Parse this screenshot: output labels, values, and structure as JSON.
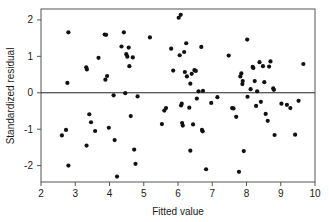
{
  "chart_data": {
    "type": "scatter",
    "title": "",
    "xlabel": "Fitted value",
    "ylabel": "Standardized residual",
    "xlim": [
      2,
      10
    ],
    "ylim": [
      -2.45,
      2.3
    ],
    "xticks": [
      2,
      3,
      4,
      5,
      6,
      7,
      8,
      9,
      10
    ],
    "xtick_labels": [
      "2",
      "3",
      "4",
      "5",
      "6",
      "7",
      "8",
      "9",
      "10"
    ],
    "yticks": [
      2,
      1,
      0,
      -1,
      -2
    ],
    "ytick_labels": [
      "2",
      "1",
      "0",
      "-1",
      "-2"
    ],
    "grid": false,
    "legend": null,
    "annotations": [
      {
        "type": "hline",
        "y": 0,
        "label": "zero-residual-reference-line"
      }
    ],
    "marker": {
      "shape": "circle",
      "size": 2.1,
      "color": "#111111"
    },
    "point_count": 100,
    "points": [
      [
        2.61,
        -1.17
      ],
      [
        2.73,
        -1.02
      ],
      [
        2.77,
        0.27
      ],
      [
        2.8,
        1.66
      ],
      [
        2.8,
        -2.0
      ],
      [
        3.32,
        0.7
      ],
      [
        3.34,
        0.64
      ],
      [
        3.33,
        -1.45
      ],
      [
        3.41,
        -0.59
      ],
      [
        3.46,
        -0.81
      ],
      [
        3.58,
        -1.05
      ],
      [
        3.68,
        0.96
      ],
      [
        3.86,
        1.6
      ],
      [
        3.9,
        1.59
      ],
      [
        3.88,
        0.36
      ],
      [
        3.93,
        0.46
      ],
      [
        3.98,
        -0.96
      ],
      [
        4.12,
        -0.07
      ],
      [
        4.15,
        -1.3
      ],
      [
        4.22,
        -2.3
      ],
      [
        4.35,
        1.27
      ],
      [
        4.42,
        1.66
      ],
      [
        4.46,
        -0.01
      ],
      [
        4.49,
        1.06
      ],
      [
        4.52,
        0.99
      ],
      [
        4.56,
        1.24
      ],
      [
        4.58,
        0.73
      ],
      [
        4.62,
        -0.64
      ],
      [
        4.68,
        0.97
      ],
      [
        4.72,
        -1.56
      ],
      [
        4.76,
        -1.95
      ],
      [
        4.82,
        -0.1
      ],
      [
        5.18,
        1.52
      ],
      [
        5.53,
        -0.86
      ],
      [
        5.6,
        -0.49
      ],
      [
        5.65,
        -0.42
      ],
      [
        5.8,
        1.21
      ],
      [
        5.86,
        0.61
      ],
      [
        6.02,
        2.06
      ],
      [
        6.08,
        2.14
      ],
      [
        6.05,
        1.03
      ],
      [
        6.09,
        -0.35
      ],
      [
        6.11,
        -0.3
      ],
      [
        6.14,
        -0.9
      ],
      [
        6.12,
        -0.83
      ],
      [
        6.18,
        1.12
      ],
      [
        6.24,
        1.36
      ],
      [
        6.2,
        0.57
      ],
      [
        6.26,
        0.45
      ],
      [
        6.33,
        -0.41
      ],
      [
        6.36,
        0.25
      ],
      [
        6.36,
        -1.59
      ],
      [
        6.4,
        0.52
      ],
      [
        6.44,
        -0.87
      ],
      [
        6.48,
        0.62
      ],
      [
        6.52,
        0.6
      ],
      [
        6.55,
        -0.16
      ],
      [
        6.6,
        0.04
      ],
      [
        6.68,
        1.26
      ],
      [
        6.7,
        -1.02
      ],
      [
        6.72,
        -1.06
      ],
      [
        6.73,
        0.05
      ],
      [
        6.82,
        -2.1
      ],
      [
        6.97,
        -0.28
      ],
      [
        7.15,
        -0.12
      ],
      [
        7.48,
        1.02
      ],
      [
        7.58,
        -0.42
      ],
      [
        7.62,
        -0.43
      ],
      [
        7.7,
        -0.66
      ],
      [
        7.78,
        -2.17
      ],
      [
        7.82,
        0.45
      ],
      [
        7.85,
        0.53
      ],
      [
        7.88,
        0.24
      ],
      [
        7.89,
        0.32
      ],
      [
        7.92,
        -1.6
      ],
      [
        8.02,
        1.46
      ],
      [
        8.03,
        -0.11
      ],
      [
        8.12,
        0.1
      ],
      [
        8.18,
        0.71
      ],
      [
        8.2,
        0.68
      ],
      [
        8.24,
        0.32
      ],
      [
        8.28,
        -0.36
      ],
      [
        8.31,
        0.04
      ],
      [
        8.38,
        0.84
      ],
      [
        8.42,
        -0.25
      ],
      [
        8.48,
        0.73
      ],
      [
        8.52,
        0.29
      ],
      [
        8.56,
        -0.58
      ],
      [
        8.62,
        -0.77
      ],
      [
        8.66,
        0.72
      ],
      [
        8.7,
        0.86
      ],
      [
        8.78,
        0.12
      ],
      [
        8.8,
        0.08
      ],
      [
        8.82,
        -1.16
      ],
      [
        9.02,
        -0.3
      ],
      [
        9.18,
        -0.33
      ],
      [
        9.28,
        -0.42
      ],
      [
        9.42,
        -1.15
      ],
      [
        9.52,
        -0.22
      ],
      [
        9.66,
        0.79
      ]
    ]
  },
  "figure": {
    "plot_area": {
      "left": 41,
      "top": 9,
      "right": 315,
      "bottom": 182
    },
    "background": "#ffffff",
    "frame_color": "#555555",
    "point_color": "#111111",
    "zero_line_color": "#222222"
  }
}
